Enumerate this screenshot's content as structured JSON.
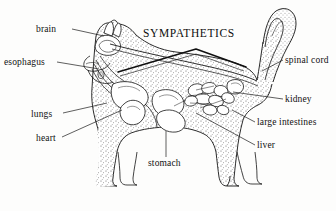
{
  "figure": {
    "title": "SYMPATHETICS",
    "style": {
      "background": "#fdfdfc",
      "ink": "#111111",
      "stipple": "#3a3a3a",
      "line_width": 0.8
    }
  },
  "labels": {
    "brain": "brain",
    "esophagus": "esophagus",
    "lungs": "lungs",
    "heart": "heart",
    "stomach": "stomach",
    "spinal_cord": "spinal cord",
    "kidney": "kidney",
    "large_intestines": "large intestines",
    "liver": "liver"
  },
  "leader_lines": [
    {
      "name": "brain",
      "from": [
        72,
        29
      ],
      "to": [
        104,
        36
      ]
    },
    {
      "name": "esophagus",
      "from": [
        57,
        62
      ],
      "to": [
        99,
        69
      ]
    },
    {
      "name": "lungs",
      "from": [
        63,
        113
      ],
      "to": [
        107,
        103
      ]
    },
    {
      "name": "heart",
      "from": [
        62,
        137
      ],
      "to": [
        122,
        110
      ]
    },
    {
      "name": "stomach",
      "from": [
        166,
        157
      ],
      "to": [
        166,
        131
      ]
    },
    {
      "name": "spinal-cord",
      "from": [
        283,
        60
      ],
      "to": [
        262,
        71
      ]
    },
    {
      "name": "kidney",
      "from": [
        283,
        99
      ],
      "to": [
        233,
        92
      ]
    },
    {
      "name": "large-intestines",
      "from": [
        255,
        122
      ],
      "to": [
        232,
        110
      ]
    },
    {
      "name": "liver",
      "from": [
        255,
        145
      ],
      "to": [
        196,
        113
      ]
    }
  ]
}
